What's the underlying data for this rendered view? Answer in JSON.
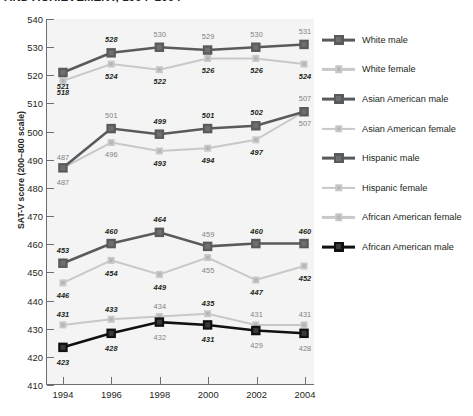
{
  "chart_title": "AND ACHIEVEMENT, 1994–2004",
  "chart_data": {
    "type": "line",
    "title": "AND ACHIEVEMENT, 1994–2004",
    "xlabel": "",
    "ylabel": "SAT-V score (200–800 scale)",
    "ylim": [
      410,
      540
    ],
    "ytick_step": 10,
    "grid": false,
    "legend_position": "right",
    "categories": [
      "1994",
      "1996",
      "1998",
      "2000",
      "2002",
      "2004"
    ],
    "series": [
      {
        "name": "White male",
        "color": "#595a5c",
        "marker": "square",
        "marker_size": "large",
        "values": [
          521,
          528,
          530,
          529,
          530,
          531
        ],
        "label_positions": [
          "below",
          "above",
          "above",
          "above",
          "above",
          "above"
        ],
        "label_style": [
          "bold",
          "bold",
          "plain",
          "plain",
          "plain",
          "plain"
        ]
      },
      {
        "name": "White female",
        "color": "#c7c8ca",
        "marker": "square",
        "marker_size": "small",
        "values": [
          518,
          524,
          522,
          526,
          526,
          524
        ],
        "label_positions": [
          "below",
          "below",
          "below",
          "below",
          "below",
          "below"
        ],
        "label_style": [
          "bold",
          "bold",
          "bold",
          "bold",
          "bold",
          "bold"
        ]
      },
      {
        "name": "Asian American male",
        "color": "#595a5c",
        "marker": "square",
        "marker_size": "large",
        "values": [
          487,
          501,
          499,
          501,
          502,
          507
        ],
        "label_positions": [
          "below",
          "above",
          "above",
          "above",
          "above",
          "above"
        ],
        "label_style": [
          "plain",
          "plain",
          "bold",
          "bold",
          "bold",
          "plain"
        ]
      },
      {
        "name": "Asian American female",
        "color": "#c7c8ca",
        "marker": "square",
        "marker_size": "small",
        "values": [
          487,
          496,
          493,
          494,
          497,
          507
        ],
        "label_positions": [
          "above",
          "below",
          "below",
          "below",
          "below",
          "below"
        ],
        "label_style": [
          "plain",
          "plain",
          "bold",
          "bold",
          "bold",
          "plain"
        ]
      },
      {
        "name": "Hispanic male",
        "color": "#595a5c",
        "marker": "square",
        "marker_size": "large",
        "values": [
          453,
          460,
          464,
          459,
          460,
          460
        ],
        "label_positions": [
          "above",
          "above",
          "above",
          "above",
          "above",
          "above"
        ],
        "label_style": [
          "bold",
          "bold",
          "bold",
          "plain",
          "bold",
          "bold"
        ]
      },
      {
        "name": "Hispanic female",
        "color": "#c7c8ca",
        "marker": "square",
        "marker_size": "small",
        "values": [
          446,
          454,
          449,
          455,
          447,
          452
        ],
        "label_positions": [
          "below",
          "below",
          "below",
          "below",
          "below",
          "below"
        ],
        "label_style": [
          "bold",
          "bold",
          "bold",
          "plain",
          "bold",
          "bold"
        ]
      },
      {
        "name": "African American female",
        "color": "#c7c8ca",
        "marker": "square",
        "marker_size": "small",
        "values": [
          431,
          433,
          434,
          435,
          431,
          431
        ],
        "label_positions": [
          "above",
          "above",
          "above",
          "above",
          "above",
          "above"
        ],
        "label_style": [
          "bold",
          "bold",
          "plain",
          "bold",
          "plain",
          "plain"
        ]
      },
      {
        "name": "African American male",
        "color": "#111111",
        "marker": "square",
        "marker_size": "large",
        "values": [
          423,
          428,
          432,
          431,
          429,
          428
        ],
        "label_positions": [
          "below",
          "below",
          "below",
          "below",
          "below",
          "below"
        ],
        "label_style": [
          "bold",
          "bold",
          "plain",
          "bold",
          "plain",
          "plain"
        ]
      }
    ]
  },
  "axes": {
    "y_ticks": [
      410,
      420,
      430,
      440,
      450,
      460,
      470,
      480,
      490,
      500,
      510,
      520,
      530,
      540
    ],
    "x_ticks": [
      "1994",
      "1996",
      "1998",
      "2000",
      "2002",
      "2004"
    ],
    "y_title": "SAT-V score (200–800 scale)"
  },
  "legend": {
    "items": [
      {
        "label": "White male",
        "color": "#595a5c",
        "size": "large"
      },
      {
        "label": "White female",
        "color": "#c7c8ca",
        "size": "small"
      },
      {
        "label": "Asian American male",
        "color": "#595a5c",
        "size": "large"
      },
      {
        "label": "Asian American female",
        "color": "#c7c8ca",
        "size": "small"
      },
      {
        "label": "Hispanic male",
        "color": "#595a5c",
        "size": "large"
      },
      {
        "label": "Hispanic female",
        "color": "#c7c8ca",
        "size": "small"
      },
      {
        "label": "African American female",
        "color": "#c7c8ca",
        "size": "small"
      },
      {
        "label": "African American male",
        "color": "#111111",
        "size": "large"
      }
    ]
  }
}
